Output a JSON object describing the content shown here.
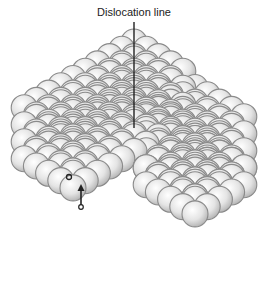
{
  "diagram": {
    "title": "Dislocation line",
    "annotations": [
      {
        "type": "line",
        "label": "Dislocation line"
      },
      {
        "type": "circle-marker"
      },
      {
        "type": "arrow",
        "direction": "up"
      }
    ],
    "colors": {
      "sphere_fill": "#e6e6e6",
      "sphere_edge": "#8a8a8a",
      "line": "#222222"
    }
  }
}
